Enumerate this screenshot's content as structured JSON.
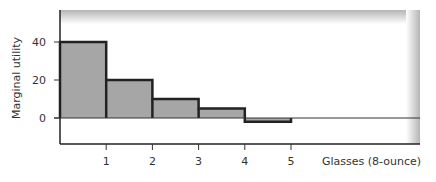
{
  "chart_data": {
    "type": "bar",
    "title": "",
    "xlabel": "Glasses (8-ounce)",
    "ylabel": "Marginal utility",
    "categories": [
      "1",
      "2",
      "3",
      "4",
      "5"
    ],
    "values": [
      40,
      20,
      10,
      5,
      -2
    ],
    "x_ticks": [
      1,
      2,
      3,
      4,
      5
    ],
    "y_ticks": [
      0,
      20,
      40
    ],
    "ylim": [
      -14,
      57
    ],
    "xlim": [
      0,
      7.8
    ],
    "grid": false,
    "legend": null,
    "zero_line": true,
    "bar_fill": "#a6a6a6",
    "bar_outline": "#222222"
  }
}
